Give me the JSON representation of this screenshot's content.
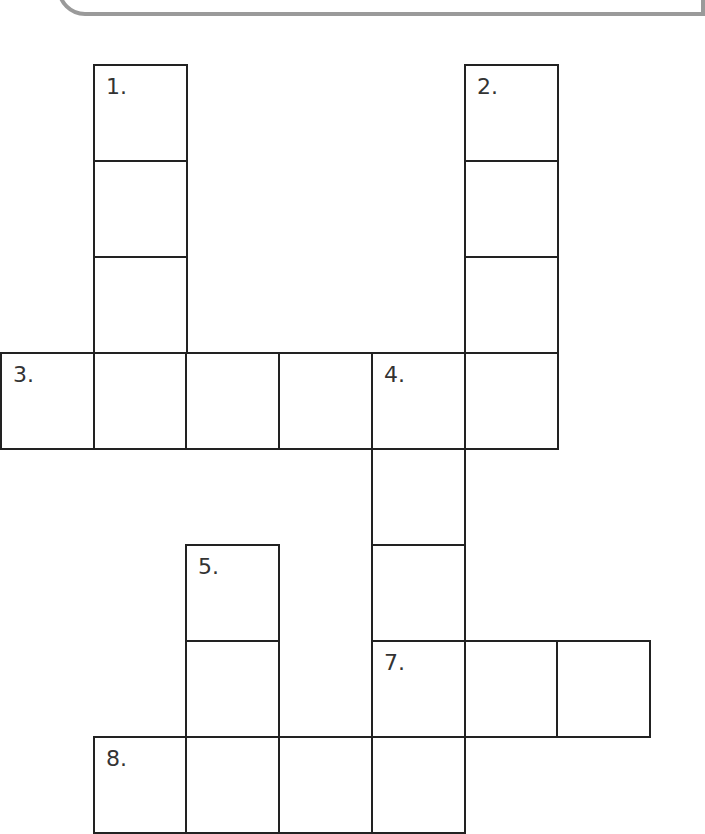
{
  "puzzle": {
    "type": "crossword-grid",
    "cell_width": 92.7,
    "cell_height": 96,
    "origin_x": 1,
    "origin_y": 65,
    "line_color": "#222222",
    "label_color": "#333333",
    "banner_color": "#9a9a9a",
    "cells": [
      {
        "col": 1,
        "row": 0,
        "label": "1."
      },
      {
        "col": 1,
        "row": 1,
        "label": ""
      },
      {
        "col": 1,
        "row": 2,
        "label": ""
      },
      {
        "col": 5,
        "row": 0,
        "label": "2."
      },
      {
        "col": 5,
        "row": 1,
        "label": ""
      },
      {
        "col": 5,
        "row": 2,
        "label": ""
      },
      {
        "col": 0,
        "row": 3,
        "label": "3."
      },
      {
        "col": 1,
        "row": 3,
        "label": ""
      },
      {
        "col": 2,
        "row": 3,
        "label": ""
      },
      {
        "col": 3,
        "row": 3,
        "label": ""
      },
      {
        "col": 4,
        "row": 3,
        "label": "4."
      },
      {
        "col": 5,
        "row": 3,
        "label": ""
      },
      {
        "col": 4,
        "row": 4,
        "label": ""
      },
      {
        "col": 4,
        "row": 5,
        "label": ""
      },
      {
        "col": 2,
        "row": 5,
        "label": "5."
      },
      {
        "col": 2,
        "row": 6,
        "label": ""
      },
      {
        "col": 4,
        "row": 6,
        "label": "7."
      },
      {
        "col": 5,
        "row": 6,
        "label": ""
      },
      {
        "col": 6,
        "row": 6,
        "label": ""
      },
      {
        "col": 1,
        "row": 7,
        "label": "8."
      },
      {
        "col": 2,
        "row": 7,
        "label": ""
      },
      {
        "col": 3,
        "row": 7,
        "label": ""
      },
      {
        "col": 4,
        "row": 7,
        "label": ""
      }
    ]
  }
}
